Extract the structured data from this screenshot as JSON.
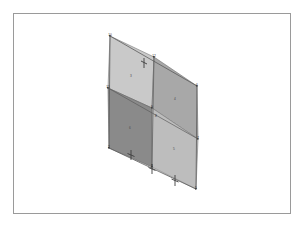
{
  "viewport": {
    "background_color": "#ffffff",
    "frame_color": "#9a9a9a",
    "name": "mesh-viewport"
  },
  "model": {
    "type": "quad-mesh",
    "projection": "isometric",
    "rows": 2,
    "columns": 2,
    "element_count": 4,
    "node_count": 9
  },
  "colors": {
    "face_light": "#c9c9c9",
    "face_medium": "#a8a8a8",
    "face_dark": "#8a8a8a",
    "face_lighter": "#bdbdbd",
    "edge": "#6e6e6e",
    "edge_dark": "#555555",
    "marker": "#3c3c3c",
    "label": "#3a3a3a"
  },
  "faces": [
    {
      "id": "face-upper-left",
      "label": "3",
      "shade": "#c9c9c9"
    },
    {
      "id": "face-upper-right",
      "label": "4",
      "shade": "#a8a8a8"
    },
    {
      "id": "face-lower-left",
      "label": "6",
      "shade": "#8a8a8a"
    },
    {
      "id": "face-lower-right",
      "label": "5",
      "shade": "#bdbdbd"
    }
  ],
  "nodes": [
    {
      "id": "n-top-left",
      "label": "10",
      "x": 110,
      "y": 36
    },
    {
      "id": "n-top-mid",
      "label": "12",
      "x": 154,
      "y": 57
    },
    {
      "id": "n-top-right",
      "label": "6",
      "x": 197,
      "y": 86
    },
    {
      "id": "n-mid-left",
      "label": "11",
      "x": 108,
      "y": 88
    },
    {
      "id": "n-center",
      "label": "9",
      "x": 152,
      "y": 108
    },
    {
      "id": "n-center-b",
      "label": "8",
      "x": 155,
      "y": 117
    },
    {
      "id": "n-mid-right",
      "label": "7",
      "x": 198,
      "y": 139
    },
    {
      "id": "n-bot-left",
      "label": "2",
      "x": 109,
      "y": 148
    },
    {
      "id": "n-bot-mid",
      "label": "1",
      "x": 152,
      "y": 167
    },
    {
      "id": "n-bot-right",
      "label": "5",
      "x": 196,
      "y": 189
    }
  ],
  "markers": [
    {
      "id": "constraint-a",
      "type": "pin-arrow",
      "x": 131,
      "y": 156
    },
    {
      "id": "constraint-b",
      "type": "pin-arrow",
      "x": 152,
      "y": 170
    },
    {
      "id": "constraint-c",
      "type": "pin-arrow",
      "x": 175,
      "y": 181
    },
    {
      "id": "constraint-d",
      "type": "pin-arrow",
      "x": 144,
      "y": 63
    }
  ],
  "geometry": {
    "outline": "110,36 197,86 196,189 109,148",
    "edge_horizontal_mid": "108,88 198,139",
    "edge_vertical_mid": "154,57 152,167"
  }
}
